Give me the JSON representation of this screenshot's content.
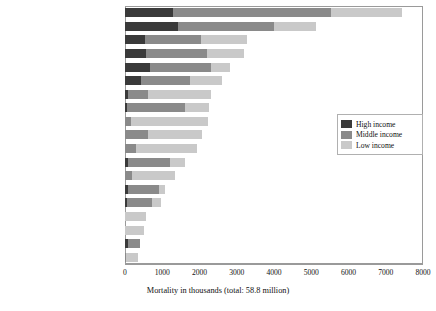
{
  "chart_data": {
    "type": "bar",
    "orientation": "horizontal",
    "stacked": true,
    "title": "",
    "xlabel": "Mortality in thousands (total: 58.8 million)",
    "ylabel": "",
    "xlim": [
      0,
      8000
    ],
    "xticks": [
      0,
      1000,
      2000,
      3000,
      4000,
      5000,
      6000,
      7000,
      8000
    ],
    "grid": false,
    "legend_position": "middle-right",
    "categories": [
      "High blood pressure",
      "Tobacco use",
      "High blood glucose",
      "Physical inactivity",
      "Overweight and obesity",
      "High cholesterol",
      "Unsafe sex",
      "Alcohol use",
      "Childhood underweight",
      "Indoor smoke from solid fuels",
      "Unsafe water, sanitation, hygiene",
      "Low fruit and  vegetable intake",
      "Suboptimal breastfeeding",
      "Urban outdoor air pollution",
      "Occupational risks",
      "Vitamin A deficiency",
      "Zinc deficiency",
      "Unsafe health-care injections",
      "Iron deficiency"
    ],
    "series": [
      {
        "name": "High income",
        "color": "#3a3a3a",
        "values": [
          1290,
          1420,
          540,
          560,
          670,
          430,
          80,
          60,
          0,
          0,
          0,
          80,
          0,
          80,
          50,
          0,
          0,
          80,
          0
        ]
      },
      {
        "name": "Middle income",
        "color": "#8a8a8a",
        "values": [
          4240,
          2580,
          1500,
          1640,
          1640,
          1320,
          540,
          1560,
          160,
          620,
          300,
          1130,
          190,
          830,
          670,
          0,
          0,
          320,
          30
        ]
      },
      {
        "name": "Low income",
        "color": "#c9c9c9",
        "values": [
          1910,
          1130,
          1240,
          990,
          510,
          860,
          1690,
          640,
          2070,
          1450,
          1630,
          400,
          1160,
          160,
          240,
          560,
          510,
          0,
          320
        ]
      }
    ],
    "totals": [
      7440,
      5130,
      3280,
      3190,
      2820,
      2610,
      2310,
      2260,
      2230,
      2070,
      1930,
      1610,
      1350,
      1070,
      960,
      560,
      510,
      400,
      350
    ]
  },
  "legend": {
    "items": [
      {
        "label": "High income",
        "key": "high"
      },
      {
        "label": "Middle income",
        "key": "mid"
      },
      {
        "label": "Low income",
        "key": "low"
      }
    ]
  },
  "axis": {
    "x_title": "Mortality in thousands (total: 58.8 million)",
    "tick_labels": [
      "0",
      "1000",
      "2000",
      "3000",
      "4000",
      "5000",
      "6000",
      "7000",
      "8000"
    ]
  }
}
